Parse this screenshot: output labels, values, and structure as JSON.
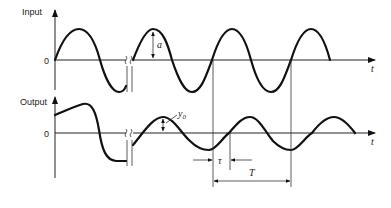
{
  "diagram": {
    "type": "signal-response-waveforms",
    "input_panel": {
      "y_label": "Input",
      "zero_label": "0",
      "x_label": "t",
      "amplitude_label": "a"
    },
    "output_panel": {
      "y_label": "Output",
      "zero_label": "0",
      "x_label": "t",
      "amplitude_label": "y0"
    },
    "annotations": {
      "lag_label": "τ",
      "period_label": "T"
    },
    "colors": {
      "line": "#111111",
      "background": "#ffffff"
    }
  }
}
